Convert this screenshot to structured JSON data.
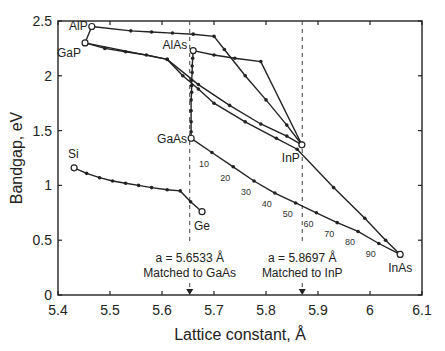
{
  "chart_data": {
    "type": "line",
    "title": "",
    "xlabel": "Lattice constant, Å",
    "ylabel": "Bandgap, eV",
    "xlim": [
      5.4,
      6.1
    ],
    "ylim": [
      0,
      2.5
    ],
    "xticks": [
      5.4,
      5.5,
      5.6,
      5.7,
      5.8,
      5.9,
      6.0,
      6.1
    ],
    "xtick_labels": [
      "5.4",
      "5.5",
      "5.6",
      "5.7",
      "5.8",
      "5.9",
      "6",
      "6.1"
    ],
    "yticks": [
      0,
      0.5,
      1.0,
      1.5,
      2.0,
      2.5
    ],
    "ytick_labels": [
      "0",
      "0.5",
      "1",
      "1.5",
      "2",
      "2.5"
    ],
    "grid": false,
    "legend": "none",
    "materials": [
      {
        "name": "AlP",
        "x": 5.465,
        "y": 2.45
      },
      {
        "name": "GaP",
        "x": 5.452,
        "y": 2.3
      },
      {
        "name": "AlAs",
        "x": 5.66,
        "y": 2.23
      },
      {
        "name": "GaAs",
        "x": 5.656,
        "y": 1.43
      },
      {
        "name": "InP",
        "x": 5.869,
        "y": 1.37
      },
      {
        "name": "InAs",
        "x": 6.058,
        "y": 0.37
      },
      {
        "name": "Si",
        "x": 5.431,
        "y": 1.16
      },
      {
        "name": "Ge",
        "x": 5.677,
        "y": 0.76
      }
    ],
    "series": [
      {
        "name": "AlP-GaP",
        "points": [
          [
            5.465,
            2.45
          ],
          [
            5.452,
            2.3
          ]
        ]
      },
      {
        "name": "AlP-InP",
        "points": [
          [
            5.465,
            2.45
          ],
          [
            5.54,
            2.41
          ],
          [
            5.58,
            2.4
          ],
          [
            5.62,
            2.39
          ],
          [
            5.66,
            2.38
          ],
          [
            5.7,
            2.36
          ],
          [
            5.72,
            2.24
          ],
          [
            5.76,
            2.0
          ],
          [
            5.8,
            1.78
          ],
          [
            5.84,
            1.55
          ],
          [
            5.869,
            1.37
          ]
        ]
      },
      {
        "name": "GaP-InAs",
        "points": [
          [
            5.452,
            2.3
          ],
          [
            5.49,
            2.25
          ],
          [
            5.53,
            2.22
          ],
          [
            5.57,
            2.19
          ],
          [
            5.61,
            2.15
          ],
          [
            5.64,
            2.0
          ],
          [
            5.67,
            1.88
          ],
          [
            5.7,
            1.75
          ],
          [
            5.76,
            1.58
          ],
          [
            5.82,
            1.43
          ],
          [
            5.86,
            1.33
          ],
          [
            5.93,
            0.98
          ],
          [
            5.99,
            0.7
          ],
          [
            6.03,
            0.5
          ],
          [
            6.058,
            0.37
          ]
        ]
      },
      {
        "name": "AlAs-InP",
        "points": [
          [
            5.66,
            2.23
          ],
          [
            5.7,
            2.19
          ],
          [
            5.74,
            2.16
          ],
          [
            5.79,
            2.13
          ],
          [
            5.869,
            1.37
          ]
        ]
      },
      {
        "name": "GaP-InP",
        "points": [
          [
            5.452,
            2.3
          ],
          [
            5.61,
            2.15
          ],
          [
            5.67,
            1.92
          ],
          [
            5.73,
            1.73
          ],
          [
            5.79,
            1.56
          ],
          [
            5.84,
            1.45
          ],
          [
            5.869,
            1.37
          ]
        ]
      },
      {
        "name": "AlAs-GaAs",
        "points": [
          [
            5.66,
            2.23
          ],
          [
            5.659,
            2.16
          ],
          [
            5.658,
            2.09
          ],
          [
            5.658,
            2.03
          ],
          [
            5.657,
            1.96
          ],
          [
            5.657,
            1.91
          ],
          [
            5.657,
            1.85
          ],
          [
            5.656,
            1.78
          ],
          [
            5.656,
            1.68
          ],
          [
            5.656,
            1.58
          ],
          [
            5.656,
            1.49
          ],
          [
            5.656,
            1.43
          ]
        ]
      },
      {
        "name": "GaAs-InAs",
        "points": [
          [
            5.656,
            1.43
          ],
          [
            5.696,
            1.3
          ],
          [
            5.737,
            1.17
          ],
          [
            5.777,
            1.04
          ],
          [
            5.817,
            0.93
          ],
          [
            5.857,
            0.84
          ],
          [
            5.897,
            0.75
          ],
          [
            5.937,
            0.66
          ],
          [
            5.977,
            0.58
          ],
          [
            6.017,
            0.47
          ],
          [
            6.058,
            0.37
          ]
        ],
        "labels": [
          "10",
          "20",
          "30",
          "40",
          "50",
          "60",
          "70",
          "80",
          "90"
        ]
      },
      {
        "name": "Si-Ge",
        "points": [
          [
            5.431,
            1.16
          ],
          [
            5.455,
            1.11
          ],
          [
            5.48,
            1.07
          ],
          [
            5.505,
            1.04
          ],
          [
            5.53,
            1.02
          ],
          [
            5.555,
            1.0
          ],
          [
            5.58,
            0.98
          ],
          [
            5.61,
            0.96
          ],
          [
            5.635,
            0.95
          ],
          [
            5.655,
            0.85
          ],
          [
            5.677,
            0.76
          ]
        ]
      }
    ],
    "annotations": [
      {
        "text": "a = 5.6533 Å",
        "subtext": "Matched to GaAs",
        "x": 5.6533
      },
      {
        "text": "a = 5.8697 Å",
        "subtext": "Matched to InP",
        "x": 5.8697
      }
    ],
    "composition_labels": [
      "10",
      "20",
      "30",
      "40",
      "50",
      "60",
      "70",
      "80",
      "90"
    ]
  },
  "colors": {
    "line": "#222222",
    "background": "#ffffff"
  }
}
